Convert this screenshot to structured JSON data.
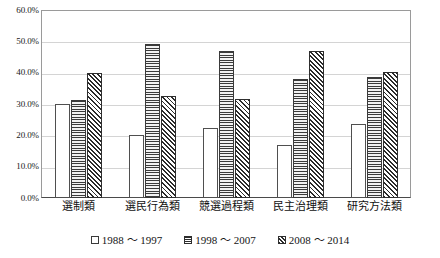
{
  "chart_data": {
    "type": "bar",
    "title": "",
    "subtitle": "",
    "xlabel": "",
    "ylabel": "",
    "ylim": [
      0,
      60
    ],
    "ytick_labels": [
      "0.0%",
      "10.0%",
      "20.0%",
      "30.0%",
      "40.0%",
      "50.0%",
      "60.0%"
    ],
    "ytick_values": [
      0,
      10,
      20,
      30,
      40,
      50,
      60
    ],
    "grid": true,
    "legend_position": "bottom-center",
    "categories": [
      "選制類",
      "選民行為類",
      "競選過程類",
      "民主治理類",
      "研究方法類"
    ],
    "series": [
      {
        "name": "1988 ～ 1997",
        "pattern": "empty-white",
        "values": [
          30.0,
          20.0,
          22.5,
          17.0,
          23.5
        ]
      },
      {
        "name": "1998 ～ 2007",
        "pattern": "horizontal-lines",
        "values": [
          31.2,
          49.0,
          47.0,
          38.0,
          38.5
        ]
      },
      {
        "name": "2008 ～ 2014",
        "pattern": "diagonal-hatch",
        "values": [
          40.0,
          32.5,
          31.5,
          47.0,
          40.2
        ]
      }
    ]
  },
  "legend": {
    "items": [
      {
        "label": "1988 ～ 1997"
      },
      {
        "label": "1998 ～ 2007"
      },
      {
        "label": "2008 ～ 2014"
      }
    ]
  },
  "colors": {
    "plot_border": "#9a9a9a",
    "axis": "#4a4a4a",
    "gridline": "#d4d4d4",
    "background": "#ffffff",
    "bar_outline": "#2e2e2e",
    "bar_series1_fill": "#ffffff",
    "bar_series2_fill": "#b9b9b9",
    "bar_series3_fill": "#ffffff"
  }
}
